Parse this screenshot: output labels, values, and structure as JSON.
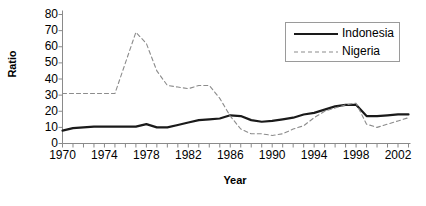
{
  "chart_data": {
    "type": "line",
    "title": "",
    "xlabel": "Year",
    "ylabel": "Ratio",
    "grid": false,
    "legend_position": "top-right",
    "xlim": [
      1970,
      2003
    ],
    "ylim": [
      0,
      80
    ],
    "y_ticks": [
      80,
      70,
      60,
      50,
      40,
      30,
      20,
      10,
      0
    ],
    "x_ticks": [
      1970,
      1971,
      1972,
      1973,
      1974,
      1975,
      1976,
      1977,
      1978,
      1979,
      1980,
      1981,
      1982,
      1983,
      1984,
      1985,
      1986,
      1987,
      1988,
      1989,
      1990,
      1991,
      1992,
      1993,
      1994,
      1995,
      1996,
      1997,
      1998,
      1999,
      2000,
      2001,
      2002,
      2003
    ],
    "x_tick_labels": [
      "1970",
      "1974",
      "1978",
      "1982",
      "1986",
      "1990",
      "1994",
      "1998",
      "2002"
    ],
    "x_tick_label_values": [
      1970,
      1974,
      1978,
      1982,
      1986,
      1990,
      1994,
      1998,
      2002
    ],
    "x": [
      1970,
      1971,
      1972,
      1973,
      1974,
      1975,
      1976,
      1977,
      1978,
      1979,
      1980,
      1981,
      1982,
      1983,
      1984,
      1985,
      1986,
      1987,
      1988,
      1989,
      1990,
      1991,
      1992,
      1993,
      1994,
      1995,
      1996,
      1997,
      1998,
      1999,
      2000,
      2001,
      2002,
      2003
    ],
    "series": [
      {
        "name": "Indonesia",
        "style": "solid",
        "color": "#1a1a1a",
        "values": [
          8,
          9.5,
          10,
          10.5,
          10.5,
          10.5,
          10.5,
          10.5,
          12,
          10,
          10,
          11.5,
          13,
          14.5,
          15,
          15.5,
          17.5,
          17,
          14.5,
          13.5,
          14,
          15,
          16,
          18,
          19,
          21,
          23,
          24,
          24,
          17,
          17,
          17.5,
          18,
          18
        ]
      },
      {
        "name": "Nigeria",
        "style": "dashed",
        "color": "#8c8c8c",
        "values": [
          31,
          31,
          31,
          31,
          31,
          31,
          50,
          69,
          62,
          45,
          36,
          35,
          34,
          36,
          36,
          28,
          17,
          9,
          6,
          6,
          5,
          6,
          9,
          11,
          16,
          20,
          22,
          24,
          25,
          12,
          10,
          12,
          14,
          16
        ]
      }
    ]
  },
  "legend": {
    "entries": [
      {
        "label": "Indonesia"
      },
      {
        "label": "Nigeria"
      }
    ]
  }
}
